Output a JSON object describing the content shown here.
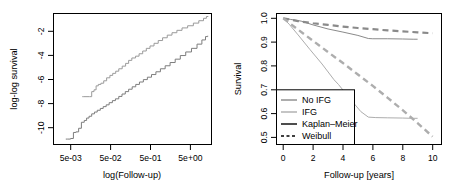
{
  "figure": {
    "background": "#ffffff",
    "panel_count": 2
  },
  "chart_data": [
    {
      "id": "left-panel",
      "type": "line",
      "title": "",
      "xlabel": "log(Follow-up)",
      "ylabel": "log-log survival",
      "xscale": "log",
      "xlim": [
        0.0025,
        11.0
      ],
      "ylim": [
        -11.6,
        -0.7
      ],
      "grid": false,
      "legend": "none",
      "xticks": [
        0.005,
        0.05,
        0.5,
        5
      ],
      "xticklabels": [
        "5e-03",
        "5e-02",
        "5e-01",
        "5e+00"
      ],
      "yticks": [
        -2,
        -4,
        -6,
        -8,
        -10
      ],
      "yticklabels": [
        "-2",
        "-4",
        "-6",
        "-8",
        "-10"
      ],
      "series": [
        {
          "name": "IFG",
          "color": "#9a9a9a",
          "linestyle": "step",
          "linewidth": 1,
          "x": [
            0.0115,
            0.0125,
            0.017,
            0.019,
            0.0215,
            0.024,
            0.027,
            0.031,
            0.036,
            0.042,
            0.05,
            0.058,
            0.068,
            0.08,
            0.096,
            0.115,
            0.135,
            0.16,
            0.195,
            0.235,
            0.285,
            0.345,
            0.42,
            0.52,
            0.65,
            0.82,
            1.05,
            1.35,
            1.75,
            2.3,
            3.1,
            4.2,
            5.6,
            7.2,
            8.4,
            9.2
          ],
          "y": [
            -7.62,
            -7.62,
            -7.62,
            -7.2,
            -7.05,
            -6.72,
            -6.6,
            -6.5,
            -6.3,
            -6.05,
            -5.85,
            -5.68,
            -5.5,
            -5.3,
            -5.08,
            -4.85,
            -4.6,
            -4.4,
            -4.25,
            -4.05,
            -3.82,
            -3.6,
            -3.4,
            -3.18,
            -2.95,
            -2.72,
            -2.5,
            -2.3,
            -2.1,
            -1.9,
            -1.72,
            -1.5,
            -1.3,
            -1.1,
            -0.95,
            -0.92
          ]
        },
        {
          "name": "No IFG",
          "color": "#7d7d7d",
          "linestyle": "step",
          "linewidth": 1,
          "x": [
            0.0048,
            0.0052,
            0.0062,
            0.0072,
            0.0082,
            0.0095,
            0.011,
            0.0128,
            0.0145,
            0.0165,
            0.019,
            0.022,
            0.0255,
            0.03,
            0.035,
            0.041,
            0.048,
            0.057,
            0.067,
            0.08,
            0.095,
            0.113,
            0.135,
            0.163,
            0.197,
            0.24,
            0.295,
            0.365,
            0.455,
            0.575,
            0.73,
            0.94,
            1.22,
            1.6,
            2.1,
            2.8,
            3.8,
            5.1,
            6.6,
            8.0,
            9.0
          ],
          "y": [
            -11.15,
            -11.15,
            -11.1,
            -10.6,
            -10.55,
            -10.25,
            -9.75,
            -9.6,
            -9.4,
            -9.25,
            -9.05,
            -8.9,
            -8.75,
            -8.6,
            -8.45,
            -8.3,
            -8.12,
            -7.95,
            -7.8,
            -7.6,
            -7.4,
            -7.2,
            -7.0,
            -6.8,
            -6.6,
            -6.4,
            -6.2,
            -6.0,
            -5.78,
            -5.55,
            -5.3,
            -5.05,
            -4.78,
            -4.5,
            -4.2,
            -3.9,
            -3.6,
            -3.25,
            -2.9,
            -2.62,
            -2.55
          ]
        }
      ]
    },
    {
      "id": "right-panel",
      "type": "line",
      "title": "",
      "xlabel": "Follow-up [years]",
      "ylabel": "Survival",
      "xscale": "linear",
      "xlim": [
        -0.45,
        10.6
      ],
      "ylim": [
        0.47,
        1.02
      ],
      "grid": false,
      "legend": "lower left",
      "xticks": [
        0,
        2,
        4,
        6,
        8,
        10
      ],
      "xticklabels": [
        "0",
        "2",
        "4",
        "6",
        "8",
        "10"
      ],
      "yticks": [
        1.0,
        0.9,
        0.8,
        0.7,
        0.6,
        0.5
      ],
      "yticklabels": [
        "1.0",
        "0.9",
        "0.8",
        "0.7",
        "0.6",
        "0.5"
      ],
      "series": [
        {
          "name": "No IFG Kaplan-Meier",
          "group": "No IFG",
          "estimator": "Kaplan-Meier",
          "color": "#8a8a8a",
          "linestyle": "solid",
          "linewidth": 1,
          "x": [
            0,
            0.5,
            1.2,
            2.0,
            3.0,
            4.0,
            5.0,
            5.7,
            6.0,
            7.0,
            8.0,
            8.7,
            9.0
          ],
          "y": [
            1.0,
            0.995,
            0.988,
            0.972,
            0.955,
            0.942,
            0.928,
            0.915,
            0.914,
            0.914,
            0.913,
            0.912,
            0.912
          ]
        },
        {
          "name": "No IFG Weibull",
          "group": "No IFG",
          "estimator": "Weibull",
          "color": "#8a8a8a",
          "linestyle": "dashed",
          "linewidth": 2.2,
          "x": [
            0,
            1,
            2,
            3,
            4,
            5,
            6,
            7,
            8,
            9,
            10
          ],
          "y": [
            1.0,
            0.988,
            0.979,
            0.972,
            0.965,
            0.959,
            0.954,
            0.949,
            0.945,
            0.941,
            0.937
          ]
        },
        {
          "name": "IFG Kaplan-Meier",
          "group": "IFG",
          "estimator": "Kaplan-Meier",
          "color": "#adadad",
          "linestyle": "solid",
          "linewidth": 1,
          "x": [
            0,
            0.4,
            1.0,
            1.8,
            2.6,
            3.4,
            3.7,
            4.5,
            5.2,
            5.7,
            6.2,
            7.0,
            8.0,
            8.6,
            9.0
          ],
          "y": [
            1.0,
            0.975,
            0.93,
            0.868,
            0.808,
            0.742,
            0.722,
            0.66,
            0.608,
            0.585,
            0.583,
            0.582,
            0.581,
            0.58,
            0.58
          ]
        },
        {
          "name": "IFG Weibull",
          "group": "IFG",
          "estimator": "Weibull",
          "color": "#adadad",
          "linestyle": "dashed",
          "linewidth": 2.4,
          "x": [
            0,
            1,
            2,
            3,
            4,
            5,
            6,
            7,
            8,
            9,
            10
          ],
          "y": [
            1.0,
            0.952,
            0.905,
            0.858,
            0.812,
            0.764,
            0.716,
            0.666,
            0.614,
            0.56,
            0.503
          ]
        }
      ],
      "legend_entries": [
        {
          "label": "No IFG",
          "color": "#8a8a8a",
          "linestyle": "solid",
          "linewidth": 1.4
        },
        {
          "label": "IFG",
          "color": "#adadad",
          "linestyle": "solid",
          "linewidth": 1.4
        },
        {
          "label": "Kaplan–Meier",
          "color": "#000000",
          "linestyle": "solid",
          "linewidth": 1.4
        },
        {
          "label": "Weibull",
          "color": "#000000",
          "linestyle": "dashed",
          "linewidth": 1.4
        }
      ]
    }
  ],
  "left_panel": {
    "xlabel": "log(Follow-up)",
    "ylabel": "log-log survival",
    "xticklabels": [
      "5e-03",
      "5e-02",
      "5e-01",
      "5e+00"
    ],
    "yticklabels": [
      "-2",
      "-4",
      "-6",
      "-8",
      "-10"
    ]
  },
  "right_panel": {
    "xlabel": "Follow-up [years]",
    "ylabel": "Survival",
    "xticklabels": [
      "0",
      "2",
      "4",
      "6",
      "8",
      "10"
    ],
    "yticklabels": [
      "1.0",
      "0.9",
      "0.8",
      "0.7",
      "0.6",
      "0.5"
    ],
    "legend": {
      "items": [
        "No IFG",
        "IFG",
        "Kaplan–Meier",
        "Weibull"
      ]
    }
  }
}
